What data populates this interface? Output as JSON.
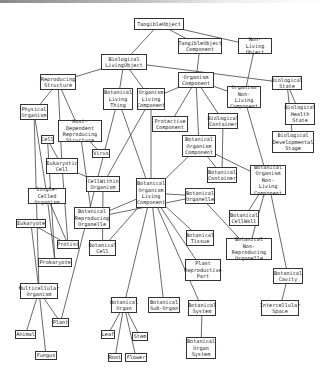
{
  "diagram": {
    "type": "ontology-hierarchy",
    "nodes": [
      {
        "id": "tangible_object",
        "label": "TangibleObject",
        "x": 134,
        "y": 18,
        "w": 50,
        "h": 12
      },
      {
        "id": "tangible_object_component",
        "label": "TangibleObject\nComponent",
        "x": 178,
        "y": 38,
        "w": 44,
        "h": 16
      },
      {
        "id": "non_living_object",
        "label": "Non-Living\nObject",
        "x": 238,
        "y": 38,
        "w": 34,
        "h": 16
      },
      {
        "id": "biological_living_object",
        "label": "Biological\nLivingObject",
        "x": 101,
        "y": 54,
        "w": 46,
        "h": 16
      },
      {
        "id": "reproducing_structure",
        "label": "Reproducing\nStructure",
        "x": 40,
        "y": 74,
        "w": 36,
        "h": 16
      },
      {
        "id": "botanical_living_thing",
        "label": "Botanical\nLiving\nThing",
        "x": 103,
        "y": 88,
        "w": 30,
        "h": 22
      },
      {
        "id": "organism_living_component",
        "label": "Organism\nLiving\nComponent",
        "x": 137,
        "y": 88,
        "w": 28,
        "h": 22
      },
      {
        "id": "organism_component",
        "label": "Organism\nComponent",
        "x": 178,
        "y": 72,
        "w": 36,
        "h": 16
      },
      {
        "id": "organism_non_living_component",
        "label": "Organism\nNon-Living\nComponent",
        "x": 227,
        "y": 86,
        "w": 34,
        "h": 22
      },
      {
        "id": "biological_state",
        "label": "Biological\nState",
        "x": 272,
        "y": 76,
        "w": 30,
        "h": 14
      },
      {
        "id": "biological_health_state",
        "label": "Biological\nHealth\nState",
        "x": 285,
        "y": 103,
        "w": 30,
        "h": 22
      },
      {
        "id": "biological_developmental_stage",
        "label": "Biological\nDevelopmental\nStage",
        "x": 272,
        "y": 131,
        "w": 42,
        "h": 22
      },
      {
        "id": "physical_organism",
        "label": "Physical\nOrganism",
        "x": 20,
        "y": 104,
        "w": 28,
        "h": 16
      },
      {
        "id": "protective_component",
        "label": "Protective\nComponent",
        "x": 152,
        "y": 116,
        "w": 36,
        "h": 16
      },
      {
        "id": "biological_container",
        "label": "Biological\nContainer",
        "x": 208,
        "y": 113,
        "w": 30,
        "h": 16
      },
      {
        "id": "cell",
        "label": "Cell",
        "x": 41,
        "y": 135,
        "w": 13,
        "h": 9
      },
      {
        "id": "host_dependent_reproducing_structure",
        "label": "Host-Dependent\nReproducing\nStructure",
        "x": 58,
        "y": 120,
        "w": 44,
        "h": 22
      },
      {
        "id": "virus",
        "label": "Virus",
        "x": 92,
        "y": 149,
        "w": 18,
        "h": 9
      },
      {
        "id": "botanical_organism_component",
        "label": "Botanical\nOrganism\nComponent",
        "x": 182,
        "y": 135,
        "w": 34,
        "h": 22
      },
      {
        "id": "eukaryotic_cell",
        "label": "Eukaryotic\nCell",
        "x": 46,
        "y": 158,
        "w": 32,
        "h": 16
      },
      {
        "id": "cell_within_organism",
        "label": "CellWithin\nOrganism",
        "x": 86,
        "y": 176,
        "w": 34,
        "h": 16
      },
      {
        "id": "botanical_container",
        "label": "Botanical\nContainer",
        "x": 207,
        "y": 167,
        "w": 30,
        "h": 16
      },
      {
        "id": "botanical_organism_non_living_component",
        "label": "Botanical\nOrganism\nNon-Living\nComponent",
        "x": 250,
        "y": 165,
        "w": 36,
        "h": 30
      },
      {
        "id": "single_celled_organism",
        "label": "Single-Celled\nOrganism",
        "x": 28,
        "y": 188,
        "w": 38,
        "h": 16
      },
      {
        "id": "botanical_organism_living_component",
        "label": "Botanical\nOrganism\nLiving\nComponent",
        "x": 136,
        "y": 178,
        "w": 30,
        "h": 30
      },
      {
        "id": "botanical_organelle",
        "label": "Botanical\nOrganelle",
        "x": 185,
        "y": 188,
        "w": 30,
        "h": 16
      },
      {
        "id": "botanical_reproducing_organelle",
        "label": "Botanical\nReproducing\nOrganelle",
        "x": 74,
        "y": 207,
        "w": 36,
        "h": 22
      },
      {
        "id": "eukaryote",
        "label": "Eukaryote",
        "x": 16,
        "y": 219,
        "w": 30,
        "h": 9
      },
      {
        "id": "botanical_cell_wall",
        "label": "Botanical\nCellWall",
        "x": 229,
        "y": 210,
        "w": 30,
        "h": 16
      },
      {
        "id": "protist",
        "label": "Protist",
        "x": 57,
        "y": 240,
        "w": 22,
        "h": 9
      },
      {
        "id": "botanical_cell",
        "label": "Botanical\nCell",
        "x": 89,
        "y": 240,
        "w": 27,
        "h": 16
      },
      {
        "id": "botanical_tissue",
        "label": "Botanical\nTissue",
        "x": 186,
        "y": 230,
        "w": 28,
        "h": 16
      },
      {
        "id": "botanical_non_reproducing_organelle",
        "label": "Botanical\nNon-Reproducing\nOrganelle",
        "x": 226,
        "y": 238,
        "w": 46,
        "h": 22
      },
      {
        "id": "prokaryote",
        "label": "Prokaryote",
        "x": 38,
        "y": 258,
        "w": 34,
        "h": 9
      },
      {
        "id": "plant_reproductive_part",
        "label": "Plant\nReproductive\nPart",
        "x": 185,
        "y": 259,
        "w": 36,
        "h": 22
      },
      {
        "id": "botanical_cavity",
        "label": "Botanical\nCavity",
        "x": 273,
        "y": 268,
        "w": 30,
        "h": 16
      },
      {
        "id": "multicellular_organism",
        "label": "Multicellular\nOrganism",
        "x": 20,
        "y": 283,
        "w": 38,
        "h": 16
      },
      {
        "id": "botanical_organ",
        "label": "Botanical\nOrgan",
        "x": 111,
        "y": 297,
        "w": 26,
        "h": 16
      },
      {
        "id": "botanical_sub_organ",
        "label": "Botanical\nSub-Organ",
        "x": 148,
        "y": 297,
        "w": 32,
        "h": 16
      },
      {
        "id": "botanical_system",
        "label": "Botanical\nSystem",
        "x": 188,
        "y": 300,
        "w": 28,
        "h": 16
      },
      {
        "id": "intercellular_space",
        "label": "Intercellular\nSpace",
        "x": 261,
        "y": 300,
        "w": 38,
        "h": 16
      },
      {
        "id": "plant",
        "label": "Plant",
        "x": 52,
        "y": 318,
        "w": 17,
        "h": 9
      },
      {
        "id": "animal",
        "label": "Animal",
        "x": 15,
        "y": 330,
        "w": 21,
        "h": 9
      },
      {
        "id": "leaf",
        "label": "Leaf",
        "x": 101,
        "y": 330,
        "w": 14,
        "h": 9
      },
      {
        "id": "stem",
        "label": "Stem",
        "x": 132,
        "y": 332,
        "w": 16,
        "h": 9
      },
      {
        "id": "botanical_organ_system",
        "label": "Botanical\nOrgan\nSystem",
        "x": 186,
        "y": 337,
        "w": 30,
        "h": 22
      },
      {
        "id": "fungus",
        "label": "Fungus",
        "x": 35,
        "y": 351,
        "w": 22,
        "h": 9
      },
      {
        "id": "root",
        "label": "Root",
        "x": 108,
        "y": 353,
        "w": 14,
        "h": 9
      },
      {
        "id": "flower",
        "label": "Flower",
        "x": 125,
        "y": 353,
        "w": 22,
        "h": 9
      }
    ],
    "edges": [
      [
        "tangible_object",
        "biological_living_object"
      ],
      [
        "tangible_object",
        "tangible_object_component"
      ],
      [
        "tangible_object",
        "non_living_object"
      ],
      [
        "tangible_object_component",
        "organism_component"
      ],
      [
        "non_living_object",
        "organism_non_living_component"
      ],
      [
        "biological_living_object",
        "reproducing_structure"
      ],
      [
        "biological_living_object",
        "botanical_living_thing"
      ],
      [
        "biological_living_object",
        "organism_living_component"
      ],
      [
        "biological_living_object",
        "biological_state"
      ],
      [
        "biological_state",
        "biological_health_state"
      ],
      [
        "biological_state",
        "biological_developmental_stage"
      ],
      [
        "organism_component",
        "organism_living_component"
      ],
      [
        "organism_component",
        "organism_non_living_component"
      ],
      [
        "organism_component",
        "protective_component"
      ],
      [
        "organism_component",
        "biological_container"
      ],
      [
        "organism_component",
        "botanical_organism_component"
      ],
      [
        "reproducing_structure",
        "physical_organism"
      ],
      [
        "reproducing_structure",
        "host_dependent_reproducing_structure"
      ],
      [
        "reproducing_structure",
        "eukaryotic_cell"
      ],
      [
        "host_dependent_reproducing_structure",
        "virus"
      ],
      [
        "host_dependent_reproducing_structure",
        "botanical_reproducing_organelle"
      ],
      [
        "physical_organism",
        "single_celled_organism"
      ],
      [
        "physical_organism",
        "multicellular_organism"
      ],
      [
        "cell",
        "eukaryotic_cell"
      ],
      [
        "cell",
        "prokaryote"
      ],
      [
        "eukaryotic_cell",
        "cell_within_organism"
      ],
      [
        "eukaryotic_cell",
        "protist"
      ],
      [
        "organism_living_component",
        "cell_within_organism"
      ],
      [
        "organism_living_component",
        "botanical_organism_living_component"
      ],
      [
        "botanical_living_thing",
        "botanical_organism_living_component"
      ],
      [
        "botanical_living_thing",
        "plant"
      ],
      [
        "cell_within_organism",
        "botanical_cell"
      ],
      [
        "botanical_organism_component",
        "botanical_organism_living_component"
      ],
      [
        "botanical_organism_component",
        "botanical_container"
      ],
      [
        "botanical_organism_component",
        "botanical_organism_non_living_component"
      ],
      [
        "biological_container",
        "botanical_container"
      ],
      [
        "organism_non_living_component",
        "botanical_organism_non_living_component"
      ],
      [
        "botanical_organism_non_living_component",
        "botanical_cell_wall"
      ],
      [
        "botanical_organism_non_living_component",
        "botanical_non_reproducing_organelle"
      ],
      [
        "botanical_organism_non_living_component",
        "botanical_cavity"
      ],
      [
        "botanical_cavity",
        "intercellular_space"
      ],
      [
        "botanical_organism_living_component",
        "botanical_organelle"
      ],
      [
        "botanical_organism_living_component",
        "botanical_reproducing_organelle"
      ],
      [
        "botanical_organism_living_component",
        "botanical_cell"
      ],
      [
        "botanical_organism_living_component",
        "botanical_tissue"
      ],
      [
        "botanical_organism_living_component",
        "plant_reproductive_part"
      ],
      [
        "botanical_organism_living_component",
        "botanical_organ"
      ],
      [
        "botanical_organism_living_component",
        "botanical_sub_organ"
      ],
      [
        "botanical_organism_living_component",
        "botanical_system"
      ],
      [
        "botanical_organelle",
        "botanical_non_reproducing_organelle"
      ],
      [
        "botanical_organelle",
        "botanical_reproducing_organelle"
      ],
      [
        "single_celled_organism",
        "protist"
      ],
      [
        "single_celled_organism",
        "prokaryote"
      ],
      [
        "eukaryote",
        "protist"
      ],
      [
        "eukaryote",
        "multicellular_organism"
      ],
      [
        "multicellular_organism",
        "plant"
      ],
      [
        "multicellular_organism",
        "animal"
      ],
      [
        "multicellular_organism",
        "fungus"
      ],
      [
        "botanical_organ",
        "leaf"
      ],
      [
        "botanical_organ",
        "stem"
      ],
      [
        "botanical_organ",
        "root"
      ],
      [
        "botanical_organ",
        "flower"
      ],
      [
        "botanical_system",
        "botanical_organ_system"
      ]
    ]
  }
}
